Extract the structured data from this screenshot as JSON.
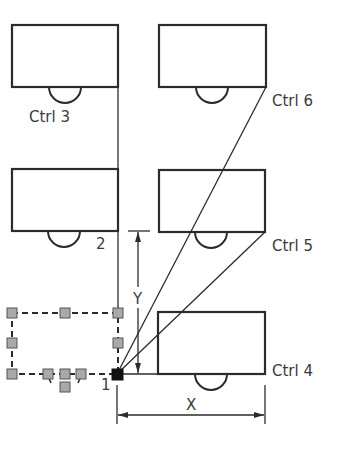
{
  "diagram": {
    "colors": {
      "stroke": "#2b2b2b",
      "grip_fill": "#a9a9a9",
      "grip_stroke": "#555555",
      "base_point": "#111111",
      "text": "#3a3a3a",
      "background": "#ffffff"
    },
    "labels": {
      "ctrl3": "Ctrl 3",
      "ctrl6": "Ctrl 6",
      "ctrl5": "Ctrl 5",
      "ctrl4": "Ctrl 4",
      "point2": "2",
      "point1": "1",
      "dim_y": "Y",
      "dim_x": "X"
    },
    "blocks": [
      {
        "id": "top-left",
        "x": 12,
        "y": 25,
        "w": 106,
        "h": 62
      },
      {
        "id": "top-right",
        "x": 159,
        "y": 25,
        "w": 107,
        "h": 62
      },
      {
        "id": "mid-left",
        "x": 12,
        "y": 169,
        "w": 106,
        "h": 62
      },
      {
        "id": "mid-right",
        "x": 159,
        "y": 170,
        "w": 106,
        "h": 62
      },
      {
        "id": "bottom-right",
        "x": 158,
        "y": 312,
        "w": 107,
        "h": 62
      }
    ],
    "selected_block": {
      "x": 12,
      "y": 313,
      "w": 106,
      "h": 61,
      "style": "dashed"
    },
    "base_point": {
      "x": 117,
      "y": 374
    },
    "dimensions": {
      "x": {
        "from": 117,
        "to": 265,
        "y": 415
      },
      "y": {
        "from": 231,
        "to": 374,
        "x": 138
      }
    }
  }
}
